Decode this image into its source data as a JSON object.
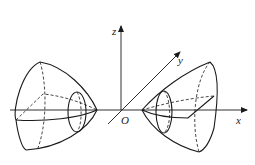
{
  "figure": {
    "axes": {
      "x_label": "x",
      "y_label": "y",
      "z_label": "z",
      "origin_label": "O"
    },
    "sheets": [
      {
        "name": "left-sheet",
        "opens_toward": "negative x"
      },
      {
        "name": "right-sheet",
        "opens_toward": "positive x"
      }
    ],
    "colors": {
      "stroke": "#1a1a1a",
      "background": "#ffffff"
    }
  }
}
